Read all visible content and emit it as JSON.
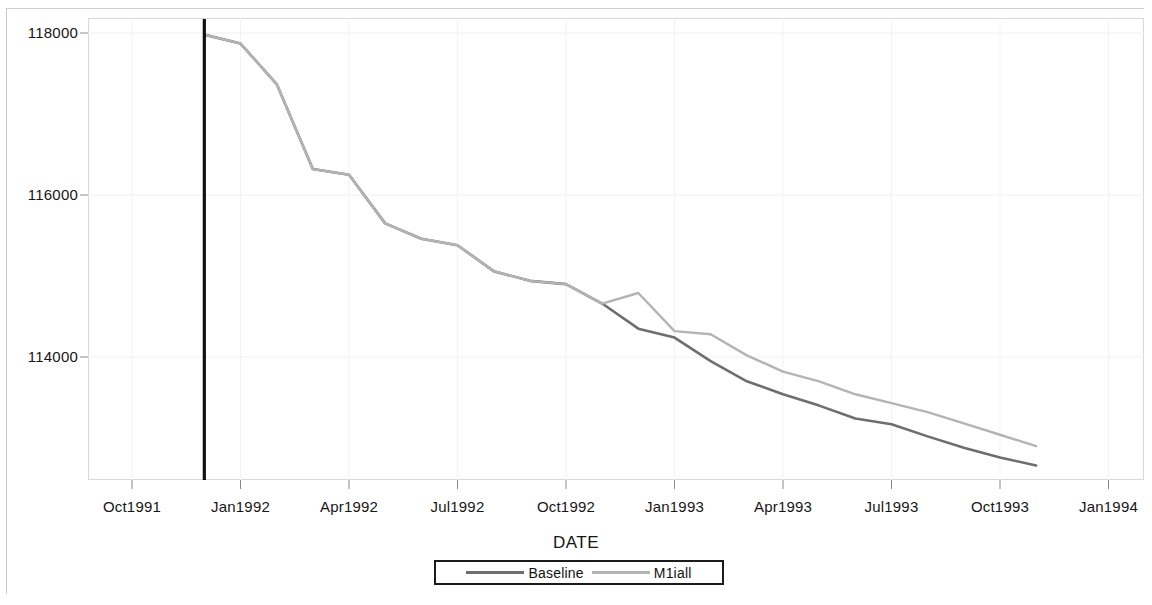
{
  "chart_data": {
    "type": "line",
    "title": "",
    "xlabel": "DATE",
    "ylabel": "",
    "grid": true,
    "legend_position": "bottom",
    "ylim": [
      112600,
      118200
    ],
    "ytick_values": [
      118000,
      116000,
      114000
    ],
    "ytick_labels": [
      "118000",
      "116000",
      "114000"
    ],
    "xtick_labels": [
      "Oct1991",
      "Jan1992",
      "Apr1992",
      "Jul1992",
      "Oct1992",
      "Jan1993",
      "Apr1993",
      "Jul1993",
      "Oct1993",
      "Jan1994"
    ],
    "x": [
      "Dec1991",
      "Jan1992",
      "Feb1992",
      "Mar1992",
      "Apr1992",
      "May1992",
      "Jun1992",
      "Jul1992",
      "Aug1992",
      "Sep1992",
      "Oct1992",
      "Nov1992",
      "Dec1992",
      "Jan1993",
      "Feb1993",
      "Mar1993",
      "Apr1993",
      "May1993",
      "Jun1993",
      "Jul1993",
      "Aug1993",
      "Sep1993",
      "Oct1993",
      "Nov1993"
    ],
    "series": [
      {
        "name": "Baseline",
        "color": "#6e6e6e",
        "values": [
          117980,
          117870,
          117370,
          116320,
          116250,
          115650,
          115460,
          115380,
          115060,
          114940,
          114900,
          114660,
          114350,
          114240,
          113950,
          113700,
          113540,
          113400,
          113240,
          113170,
          113020,
          112880,
          112760,
          112660
        ]
      },
      {
        "name": "M1iall",
        "color": "#b4b4b4",
        "values": [
          117980,
          117870,
          117370,
          116320,
          116250,
          115650,
          115460,
          115380,
          115060,
          114940,
          114900,
          114660,
          114790,
          114320,
          114280,
          114020,
          113820,
          113700,
          113540,
          113430,
          113320,
          113180,
          113040,
          112900
        ]
      }
    ],
    "reference_line": {
      "name": "intervention-line",
      "x": "Dec1991",
      "color": "#111111"
    },
    "annotations": []
  },
  "axis": {
    "x_title": "DATE"
  },
  "legend": {
    "items": [
      {
        "label": "Baseline",
        "swatch": "baseline-line-swatch"
      },
      {
        "label": "M1iall",
        "swatch": "m1iall-line-swatch"
      }
    ]
  }
}
